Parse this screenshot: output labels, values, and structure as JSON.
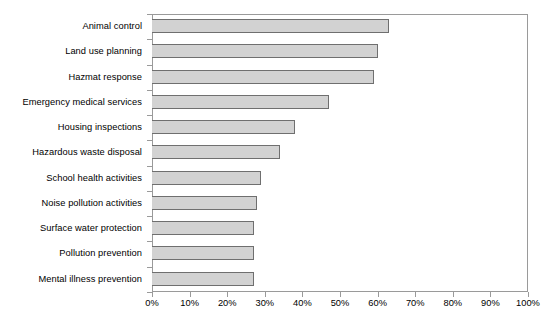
{
  "chart_data": {
    "type": "bar",
    "orientation": "horizontal",
    "title": "",
    "subtitle": "",
    "xlabel": "",
    "ylabel": "",
    "xlim": [
      0,
      100
    ],
    "xtick_labels": [
      "0%",
      "10%",
      "20%",
      "30%",
      "40%",
      "50%",
      "60%",
      "70%",
      "80%",
      "90%",
      "100%"
    ],
    "xtick_values": [
      0,
      10,
      20,
      30,
      40,
      50,
      60,
      70,
      80,
      90,
      100
    ],
    "grid": false,
    "legend": null,
    "legend_position": "none",
    "categories": [
      "Animal control",
      "Land use planning",
      "Hazmat response",
      "Emergency medical services",
      "Housing inspections",
      "Hazardous waste disposal",
      "School health activities",
      "Noise pollution activities",
      "Surface water protection",
      "Pollution prevention",
      "Mental illness prevention"
    ],
    "values": [
      63,
      60,
      59,
      47,
      38,
      34,
      29,
      28,
      27,
      27,
      27
    ],
    "bar_fill_color": "#d2d2d2",
    "bar_border_color": "#6f6f6f",
    "axis_color": "#9a9a9a",
    "background_color": "#ffffff"
  }
}
